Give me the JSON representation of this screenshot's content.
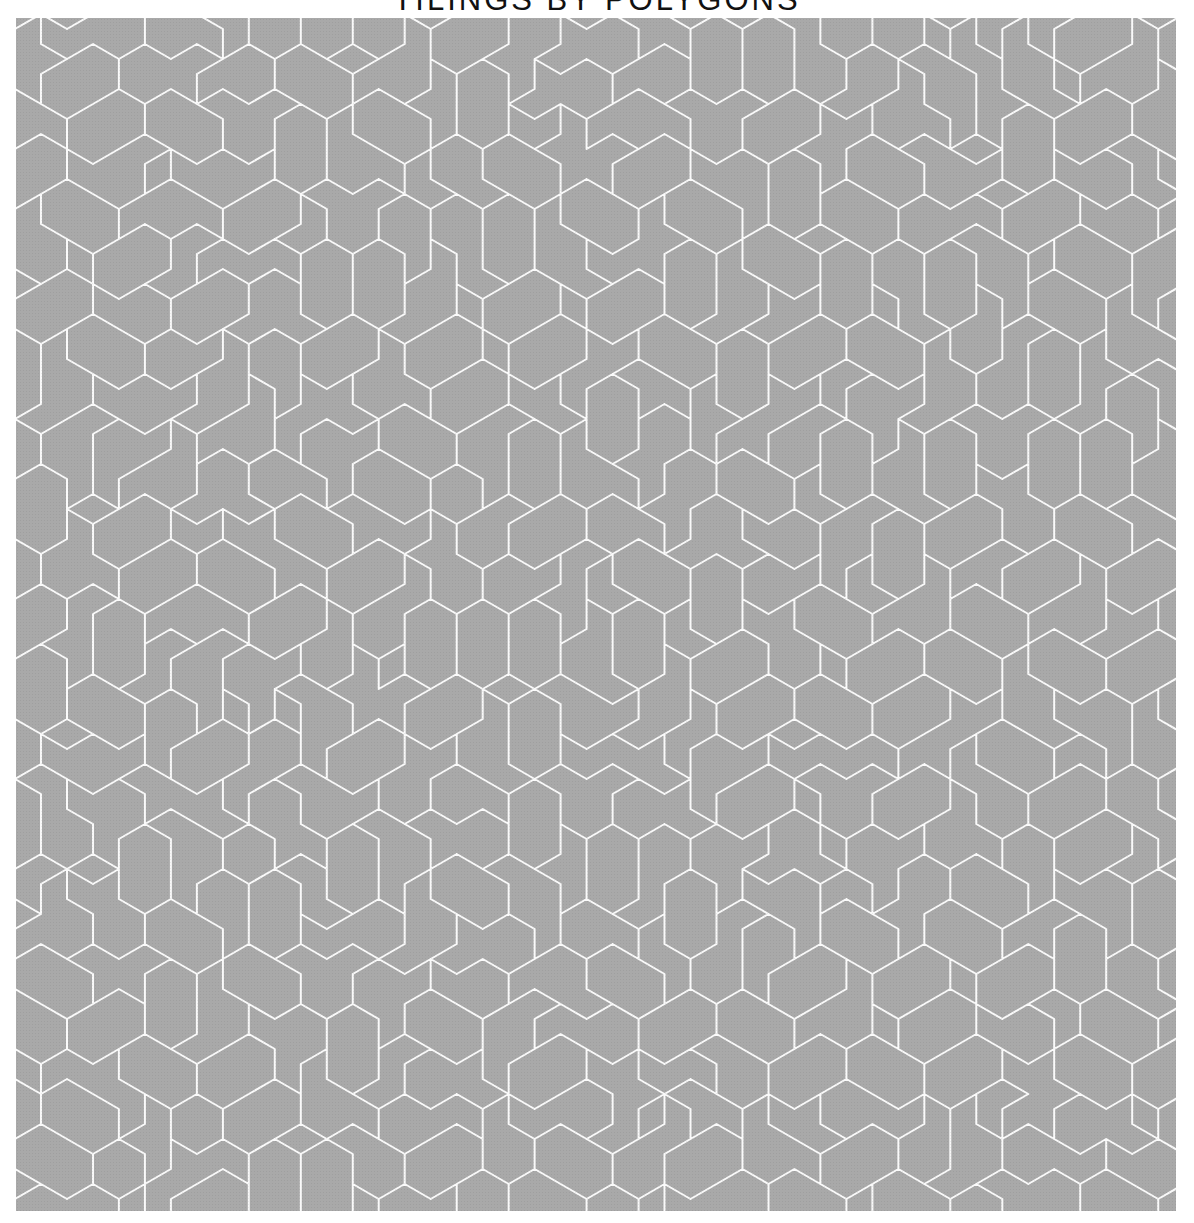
{
  "header": {
    "title": "TILINGS BY POLYGONS"
  },
  "figure": {
    "colors": {
      "background": "#a9a9a9",
      "line": "#fafafa",
      "page": "#ffffff",
      "title": "#111111"
    },
    "pattern": {
      "lattice": "hexagonal-rhombille",
      "edge_length_px": 30,
      "line_width_px": 2,
      "origin_x": 25,
      "origin_y": 26,
      "target_tile_rhombi": 5,
      "seed": 1337
    }
  }
}
